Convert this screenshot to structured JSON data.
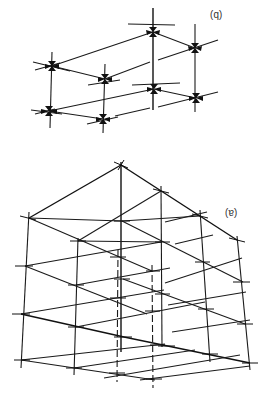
{
  "figure": {
    "orientation": "rotated 180 degrees",
    "panels": [
      {
        "id": "b",
        "label": "(b)",
        "rendered_label": "(q)",
        "description": "Two-level lattice of 8 nodes with inward-pointing arrow pairs at each joint"
      },
      {
        "id": "a",
        "label": "(a)",
        "rendered_label": "(e)",
        "description": "3D cubic framework of intersecting lines with cross-tick marks at joints"
      }
    ]
  },
  "labels": {
    "b": "(b)",
    "a": "(a)"
  }
}
